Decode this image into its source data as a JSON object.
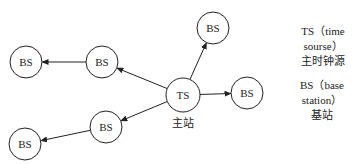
{
  "diagram": {
    "nodes": [
      {
        "id": "ts",
        "label": "TS",
        "caption": "主站",
        "cx": 183,
        "cy": 95,
        "r": 17
      },
      {
        "id": "bs_top",
        "label": "BS",
        "cx": 213,
        "cy": 28,
        "r": 16
      },
      {
        "id": "bs_right",
        "label": "BS",
        "cx": 247,
        "cy": 93,
        "r": 16
      },
      {
        "id": "bs_upper_mid",
        "label": "BS",
        "cx": 102,
        "cy": 62,
        "r": 16
      },
      {
        "id": "bs_upper_left",
        "label": "BS",
        "cx": 26,
        "cy": 62,
        "r": 16
      },
      {
        "id": "bs_lower_mid",
        "label": "BS",
        "cx": 106,
        "cy": 127,
        "r": 16
      },
      {
        "id": "bs_lower_left",
        "label": "BS",
        "cx": 25,
        "cy": 144,
        "r": 16
      }
    ],
    "edges": [
      {
        "from": "ts",
        "to": "bs_top"
      },
      {
        "from": "ts",
        "to": "bs_right"
      },
      {
        "from": "ts",
        "to": "bs_upper_mid"
      },
      {
        "from": "ts",
        "to": "bs_lower_mid"
      },
      {
        "from": "bs_upper_mid",
        "to": "bs_upper_left"
      },
      {
        "from": "bs_lower_mid",
        "to": "bs_lower_left"
      }
    ],
    "ts_caption": "主站"
  },
  "legend": {
    "ts": {
      "abbr": "TS",
      "english": "（time sourse）",
      "chinese": "主时钟源"
    },
    "bs": {
      "abbr": "BS",
      "english": "（base station）",
      "chinese": "基站"
    }
  },
  "colors": {
    "stroke": "#222222",
    "background": "#ffffff"
  }
}
